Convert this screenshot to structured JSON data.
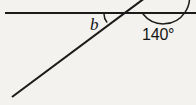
{
  "figure": {
    "background_color": "#f4f2ef",
    "stroke_color": "#1b1b1b",
    "labels": {
      "unknown_angle": "b",
      "known_angle": "140°"
    },
    "elements": {
      "horizontal_line_name": "straight-line",
      "ray_name": "transversal-ray",
      "small_arc_name": "angle-arc-b",
      "large_arc_name": "angle-arc-140"
    },
    "geometry": {
      "vertex": {
        "x": 117,
        "y": 14
      },
      "horizontal_line": {
        "x1": 5,
        "y1": 13,
        "x2": 196,
        "y2": 13
      },
      "ray": {
        "x1": 12,
        "y1": 97,
        "x2": 143,
        "y2": 0
      },
      "small_arc_radius": 13,
      "large_arc_radius": 26
    }
  }
}
